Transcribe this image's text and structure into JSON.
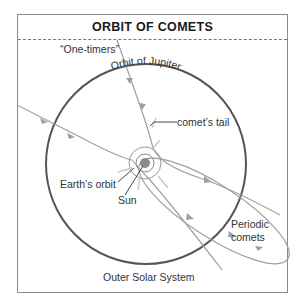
{
  "title": "ORBIT OF COMETS",
  "labels": {
    "one_timers": "“One-timers”",
    "orbit_of_jupiter": "Orbit of Jupiter",
    "comets_tail": "comet’s tail",
    "earths_orbit": "Earth’s orbit",
    "sun": "Sun",
    "periodic_line1": "Periodic",
    "periodic_line2": "comets",
    "outer_solar_system": "Outer Solar System"
  },
  "colors": {
    "jupiter_orbit": "#555555",
    "comet_path": "#a0a0a0",
    "sun": "#8c8c8c",
    "frame": "#8a8a8a"
  }
}
